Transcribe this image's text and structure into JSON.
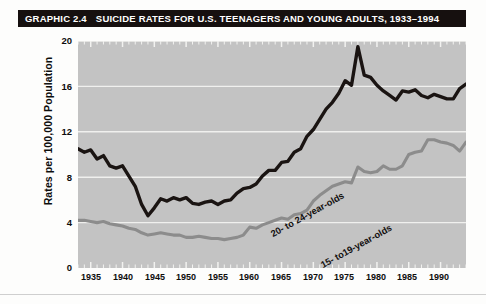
{
  "title": {
    "graphic_number": "GRAPHIC 2.4",
    "text": "SUICIDE RATES FOR U.S. TEENAGERS AND YOUNG ADULTS, 1933–1994"
  },
  "axes": {
    "ylabel": "Rates per 100,000 Population",
    "yticks": [
      "20",
      "16",
      "12",
      "8",
      "4",
      "0"
    ],
    "xticks": [
      "1935",
      "1940",
      "1945",
      "1950",
      "1955",
      "1960",
      "1965",
      "1970",
      "1975",
      "1980",
      "1985",
      "1990"
    ]
  },
  "series_labels": {
    "older": "20- to 24-year-olds",
    "younger": "15- to19-year-olds"
  },
  "colors": {
    "title_bar": "#16100f",
    "plot_background": "#c3c3c3",
    "gridline": "#f0f0ee",
    "series_older": "#1a1412",
    "series_younger": "#8c8c8c"
  },
  "chart_data": {
    "type": "line",
    "title": "SUICIDE RATES FOR U.S. TEENAGERS AND YOUNG ADULTS, 1933–1994",
    "xlabel": "",
    "ylabel": "Rates per 100,000 Population",
    "xlim": [
      1933,
      1994
    ],
    "ylim": [
      0,
      20
    ],
    "grid": true,
    "legend": "inline-labels",
    "x": [
      1933,
      1934,
      1935,
      1936,
      1937,
      1938,
      1939,
      1940,
      1941,
      1942,
      1943,
      1944,
      1945,
      1946,
      1947,
      1948,
      1949,
      1950,
      1951,
      1952,
      1953,
      1954,
      1955,
      1956,
      1957,
      1958,
      1959,
      1960,
      1961,
      1962,
      1963,
      1964,
      1965,
      1966,
      1967,
      1968,
      1969,
      1970,
      1971,
      1972,
      1973,
      1974,
      1975,
      1976,
      1977,
      1978,
      1979,
      1980,
      1981,
      1982,
      1983,
      1984,
      1985,
      1986,
      1987,
      1988,
      1989,
      1990,
      1991,
      1992,
      1993,
      1994
    ],
    "series": [
      {
        "name": "20- to 24-year-olds",
        "color": "#1a1412",
        "values": [
          10.5,
          10.2,
          10.4,
          9.6,
          9.9,
          9.0,
          8.8,
          9.0,
          8.1,
          7.2,
          5.6,
          4.6,
          5.3,
          6.1,
          5.9,
          6.2,
          6.0,
          6.2,
          5.7,
          5.6,
          5.8,
          5.9,
          5.6,
          5.9,
          6.0,
          6.6,
          7.0,
          7.1,
          7.4,
          8.1,
          8.6,
          8.6,
          9.3,
          9.4,
          10.2,
          10.5,
          11.6,
          12.2,
          13.1,
          14.0,
          14.6,
          15.4,
          16.5,
          16.1,
          19.5,
          17.0,
          16.8,
          16.1,
          15.6,
          15.2,
          14.8,
          15.6,
          15.5,
          15.7,
          15.2,
          15.0,
          15.3,
          15.1,
          14.9,
          14.9,
          15.8,
          16.2
        ]
      },
      {
        "name": "15- to19-year-olds",
        "color": "#8c8c8c",
        "values": [
          4.2,
          4.2,
          4.1,
          4.0,
          4.1,
          3.9,
          3.8,
          3.7,
          3.5,
          3.4,
          3.1,
          2.9,
          3.0,
          3.1,
          3.0,
          2.9,
          2.9,
          2.7,
          2.7,
          2.8,
          2.7,
          2.6,
          2.6,
          2.5,
          2.6,
          2.7,
          2.9,
          3.6,
          3.5,
          3.8,
          4.0,
          4.2,
          4.4,
          4.3,
          4.7,
          4.8,
          5.1,
          5.9,
          6.4,
          6.8,
          7.2,
          7.4,
          7.6,
          7.5,
          8.9,
          8.5,
          8.4,
          8.5,
          9.0,
          8.7,
          8.7,
          9.0,
          10.0,
          10.2,
          10.3,
          11.3,
          11.3,
          11.1,
          11.0,
          10.8,
          10.3,
          11.1
        ]
      }
    ]
  }
}
